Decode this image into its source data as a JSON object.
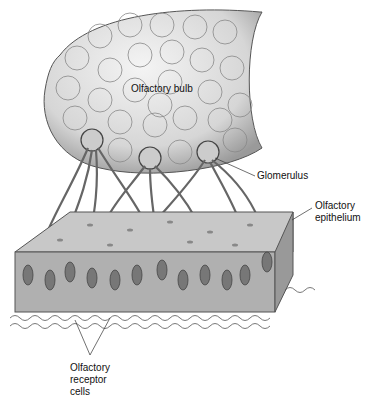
{
  "diagram": {
    "labels": {
      "bulb": "Olfactory bulb",
      "glomerulus": "Glomerulus",
      "epithelium": "Olfactory\nepithelium",
      "receptor": "Olfactory\nreceptor\ncells"
    }
  }
}
